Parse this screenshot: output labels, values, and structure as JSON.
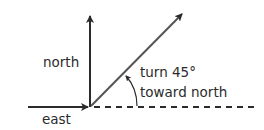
{
  "diagram": {
    "labels": {
      "north": "north",
      "east": "east",
      "turn_line1": "turn 45°",
      "turn_line2": "toward north"
    },
    "angle_degrees": 45,
    "colors": {
      "stroke": "#2b2b2b",
      "text": "#2b2b2b",
      "background": "#ffffff"
    }
  }
}
